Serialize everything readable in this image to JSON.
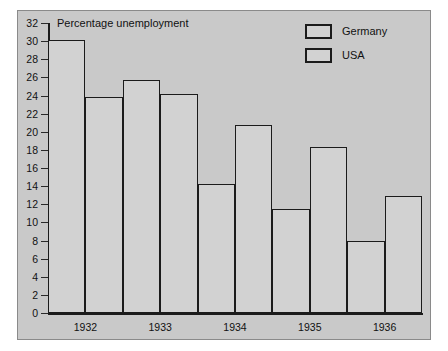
{
  "chart_data": {
    "type": "bar",
    "title": "Percentage unemployment",
    "xlabel": "",
    "ylabel": "",
    "categories": [
      "1932",
      "1933",
      "1934",
      "1935",
      "1936"
    ],
    "series": [
      {
        "name": "Germany",
        "values": [
          30.1,
          25.7,
          14.2,
          11.5,
          7.9
        ]
      },
      {
        "name": "USA",
        "values": [
          23.8,
          24.2,
          20.8,
          18.3,
          12.9
        ]
      }
    ],
    "ylim": [
      0,
      32
    ],
    "yticks": [
      0,
      2,
      4,
      6,
      8,
      10,
      12,
      14,
      16,
      18,
      20,
      22,
      24,
      26,
      28,
      30,
      32
    ],
    "ytick_labels": [
      "0",
      "2",
      "4",
      "6",
      "8",
      "10",
      "12",
      "14",
      "16",
      "18",
      "20",
      "22",
      "24",
      "26",
      "28",
      "30",
      "32"
    ],
    "grid": false,
    "legend_position": "top-right",
    "bar_fill_color": "#d2d2d2",
    "bar_edge_color": "#1b1b1b",
    "panel_background_color": "#c9c9c9"
  },
  "legend": {
    "entries": [
      {
        "label": "Germany"
      },
      {
        "label": "USA"
      }
    ]
  }
}
